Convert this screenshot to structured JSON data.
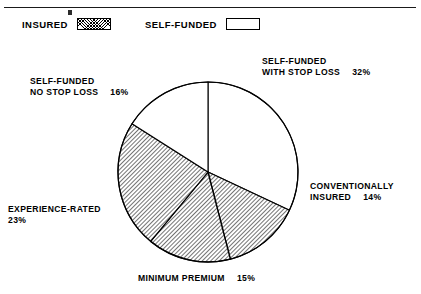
{
  "legend": {
    "items": [
      {
        "label": "INSURED",
        "swatch": "hatched-swatch"
      },
      {
        "label": "SELF-FUNDED",
        "swatch": "white-swatch"
      }
    ]
  },
  "labels": {
    "self_funded_with_stop_loss": {
      "line1": "SELF-FUNDED",
      "line2": "WITH STOP LOSS",
      "percent": "32%"
    },
    "self_funded_no_stop_loss": {
      "line1": "SELF-FUNDED",
      "line2": "NO STOP LOSS",
      "percent": "16%"
    },
    "conventionally_insured": {
      "line1": "CONVENTIONALLY",
      "line2": "INSURED",
      "percent": "14%"
    },
    "experience_rated": {
      "line1": "EXPERIENCE-RATED",
      "line2": "23%",
      "percent": ""
    },
    "minimum_premium": {
      "line1": "MINIMUM PREMIUM",
      "percent": "15%"
    }
  },
  "colors": {
    "outline": "#000000",
    "insured_fill": "#ffffff",
    "self_funded_fill": "#ffffff",
    "hatch_line": "#000000",
    "text": "#000000"
  },
  "chart_data": {
    "type": "pie",
    "title": "",
    "categories": [
      "SELF-FUNDED WITH STOP LOSS",
      "CONVENTIONALLY INSURED",
      "MINIMUM PREMIUM",
      "EXPERIENCE-RATED",
      "SELF-FUNDED NO STOP LOSS"
    ],
    "values": [
      32,
      14,
      15,
      23,
      16
    ],
    "unit": "%",
    "legend_position": "top-left",
    "grid": false,
    "groups": [
      {
        "name": "INSURED",
        "fill": "hatched",
        "total": 52,
        "members": [
          "CONVENTIONALLY INSURED",
          "MINIMUM PREMIUM",
          "EXPERIENCE-RATED"
        ]
      },
      {
        "name": "SELF-FUNDED",
        "fill": "white",
        "total": 48,
        "members": [
          "SELF-FUNDED WITH STOP LOSS",
          "SELF-FUNDED NO STOP LOSS"
        ]
      }
    ],
    "slices": [
      {
        "label": "SELF-FUNDED WITH STOP LOSS",
        "value": 32,
        "fill": "white",
        "start_deg": 0,
        "end_deg": 115.2
      },
      {
        "label": "CONVENTIONALLY INSURED",
        "value": 14,
        "fill": "hatched",
        "start_deg": 115.2,
        "end_deg": 165.6
      },
      {
        "label": "MINIMUM PREMIUM",
        "value": 15,
        "fill": "hatched",
        "start_deg": 165.6,
        "end_deg": 219.6
      },
      {
        "label": "EXPERIENCE-RATED",
        "value": 23,
        "fill": "hatched",
        "start_deg": 219.6,
        "end_deg": 302.4
      },
      {
        "label": "SELF-FUNDED NO STOP LOSS",
        "value": 16,
        "fill": "white",
        "start_deg": 302.4,
        "end_deg": 360
      }
    ],
    "center": {
      "x": 208,
      "y": 172
    },
    "radius": 90
  }
}
